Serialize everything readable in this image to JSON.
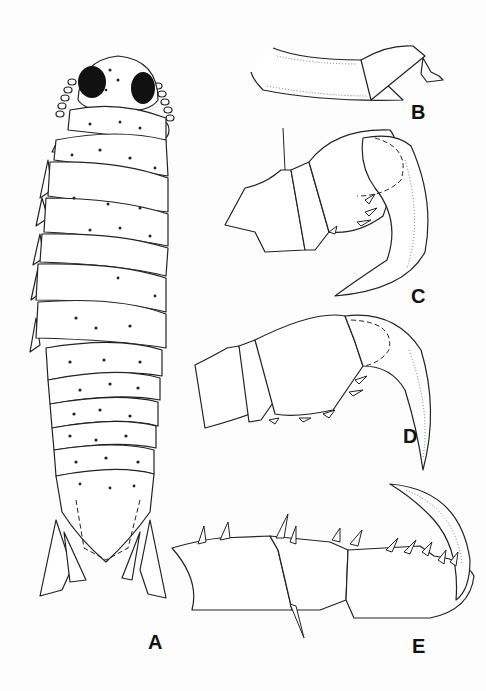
{
  "figure": {
    "background": "#fdfdfd",
    "ink_color": "#222222",
    "panels": [
      {
        "id": "A",
        "label": "A",
        "description": "Isopod habitus, dorsal view, with pigment spots and dark eyes"
      },
      {
        "id": "B",
        "label": "B",
        "description": "Appendage segment, lateral view"
      },
      {
        "id": "C",
        "label": "C",
        "description": "Prehensile pereopod with strongly curved dactylus"
      },
      {
        "id": "D",
        "label": "D",
        "description": "Prehensile pereopod with curved dactylus and spines"
      },
      {
        "id": "E",
        "label": "E",
        "description": "Ambulatory pereopod with dorsal spines and curved dactylus"
      }
    ]
  }
}
